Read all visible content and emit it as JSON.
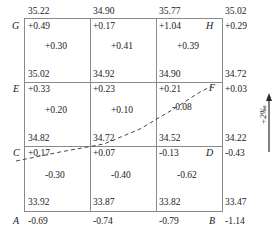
{
  "figure": {
    "type": "survey-levelling-grid",
    "gradient_annotation": "+2‰",
    "colors": {
      "grid_line": "#8a8a8a",
      "text": "#1a1a1a",
      "dashed_line": "#4a4a4a"
    }
  },
  "corner_labels": {
    "top_left": "G",
    "top_right": "H",
    "mid_left": "E",
    "mid_right": "F",
    "low_left": "C",
    "low_right": "D",
    "bottom_left": "A",
    "bottom_right": "B"
  },
  "node_rows": [
    {
      "values": [
        "35.22",
        "34.90",
        "35.77",
        "35.02"
      ]
    },
    {
      "values": [
        "35.02",
        "34.92",
        "34.90",
        "34.72"
      ]
    },
    {
      "values": [
        "34.82",
        "34.72",
        "34.52",
        "34.22"
      ]
    },
    {
      "values": [
        "33.92",
        "33.87",
        "33.82",
        "33.47"
      ]
    }
  ],
  "correction_rows": [
    {
      "values": [
        "+0.49",
        "+0.17",
        "+1.04",
        "+0.29"
      ]
    },
    {
      "values": [
        "+0.33",
        "+0.23",
        "+0.21",
        "+0.03"
      ]
    },
    {
      "values": [
        "+0.17",
        "+0.07",
        "-0.13",
        "-0.43"
      ]
    },
    {
      "values": [
        "-0.69",
        "-0.74",
        "-0.79",
        "-1.14"
      ]
    }
  ],
  "cell_interior_rows": [
    {
      "values": [
        "+0.30",
        "+0.41",
        "+0.39"
      ]
    },
    {
      "values": [
        "+0.20",
        "+0.10",
        "-0.08"
      ]
    },
    {
      "values": [
        "-0.30",
        "-0.40",
        "-0.62"
      ]
    }
  ]
}
